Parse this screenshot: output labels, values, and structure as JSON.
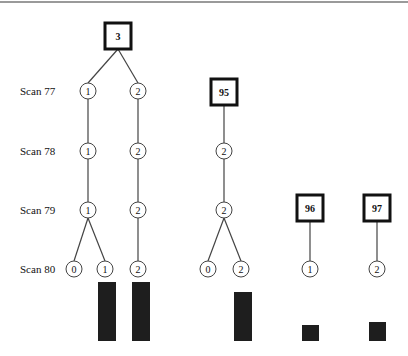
{
  "diagram": {
    "type": "tree",
    "scan_labels": [
      {
        "text": "Scan 77",
        "y": 91
      },
      {
        "text": "Scan 78",
        "y": 151
      },
      {
        "text": "Scan 79",
        "y": 210
      },
      {
        "text": "Scan 80",
        "y": 269
      }
    ],
    "roots": [
      {
        "id": "r3",
        "label": "3",
        "x": 118,
        "y": 36
      },
      {
        "id": "r95",
        "label": "95",
        "x": 224,
        "y": 92
      },
      {
        "id": "r96",
        "label": "96",
        "x": 310,
        "y": 208
      },
      {
        "id": "r97",
        "label": "97",
        "x": 377,
        "y": 208
      }
    ],
    "nodes": [
      {
        "id": "a77",
        "label": "1",
        "x": 88,
        "y": 91
      },
      {
        "id": "b77",
        "label": "2",
        "x": 138,
        "y": 91
      },
      {
        "id": "a78",
        "label": "1",
        "x": 88,
        "y": 151
      },
      {
        "id": "b78",
        "label": "2",
        "x": 138,
        "y": 151
      },
      {
        "id": "c78",
        "label": "2",
        "x": 224,
        "y": 151
      },
      {
        "id": "a79",
        "label": "1",
        "x": 88,
        "y": 210
      },
      {
        "id": "b79",
        "label": "2",
        "x": 138,
        "y": 210
      },
      {
        "id": "c79",
        "label": "2",
        "x": 224,
        "y": 210
      },
      {
        "id": "a80a",
        "label": "0",
        "x": 74,
        "y": 269
      },
      {
        "id": "a80b",
        "label": "1",
        "x": 105,
        "y": 269
      },
      {
        "id": "b80",
        "label": "2",
        "x": 138,
        "y": 269
      },
      {
        "id": "c80a",
        "label": "0",
        "x": 208,
        "y": 269
      },
      {
        "id": "c80b",
        "label": "2",
        "x": 241,
        "y": 269
      },
      {
        "id": "d80",
        "label": "1",
        "x": 310,
        "y": 269
      },
      {
        "id": "e80",
        "label": "2",
        "x": 377,
        "y": 269
      }
    ],
    "edges": [
      [
        "r3",
        "a77"
      ],
      [
        "r3",
        "b77"
      ],
      [
        "a77",
        "a78"
      ],
      [
        "b77",
        "b78"
      ],
      [
        "r95",
        "c78"
      ],
      [
        "a78",
        "a79"
      ],
      [
        "b78",
        "b79"
      ],
      [
        "c78",
        "c79"
      ],
      [
        "a79",
        "a80a"
      ],
      [
        "a79",
        "a80b"
      ],
      [
        "b79",
        "b80"
      ],
      [
        "c79",
        "c80a"
      ],
      [
        "c79",
        "c80b"
      ],
      [
        "r96",
        "d80"
      ],
      [
        "r97",
        "e80"
      ]
    ],
    "bars": [
      {
        "under": "a80b",
        "x": 98,
        "top": 282,
        "width": 18,
        "bottom": 341
      },
      {
        "under": "b80",
        "x": 132,
        "top": 282,
        "width": 18,
        "bottom": 341
      },
      {
        "under": "c80b",
        "x": 234,
        "top": 292,
        "width": 18,
        "bottom": 341
      },
      {
        "under": "d80",
        "x": 302,
        "top": 325,
        "width": 17,
        "bottom": 341
      },
      {
        "under": "e80",
        "x": 369,
        "top": 322,
        "width": 17,
        "bottom": 341
      }
    ]
  },
  "colors": {
    "line": "#444444",
    "box_border": "#111111",
    "bar": "#1e1e1e",
    "top_rule": "#9a9a9a"
  }
}
